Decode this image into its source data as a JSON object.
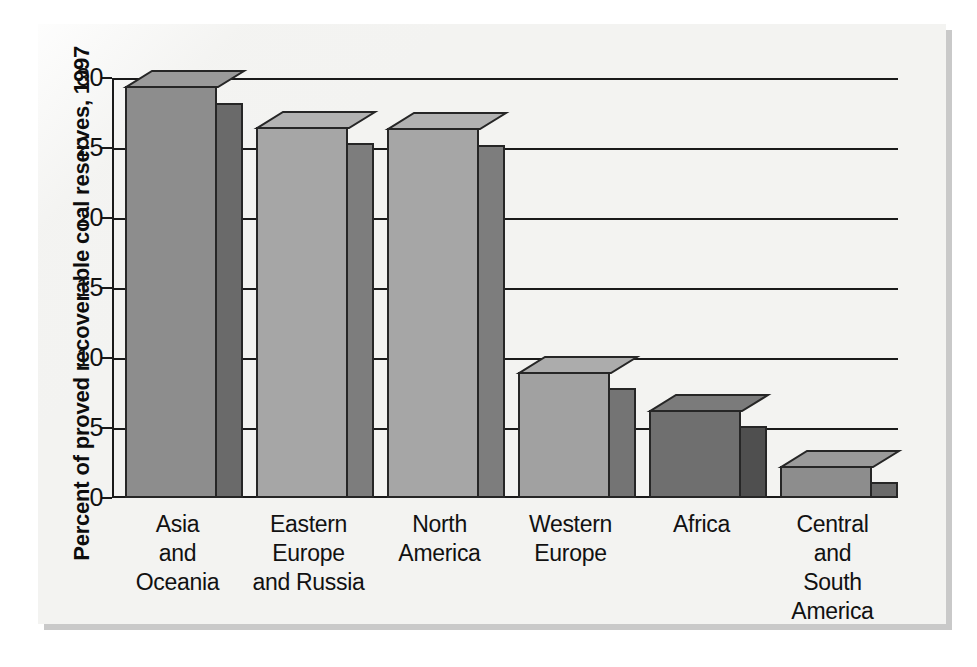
{
  "chart_data": {
    "type": "bar",
    "title": "",
    "subtitle": "",
    "xlabel": "",
    "ylabel": "Percent of proved recoverable coal reserves, 1997",
    "categories": [
      "Asia\nand\nOceania",
      "Eastern\nEurope\nand Russia",
      "North\nAmerica",
      "Western\nEurope",
      "Africa",
      "Central\nand\nSouth\nAmerica"
    ],
    "values": [
      29.4,
      26.5,
      26.4,
      9.0,
      6.3,
      2.3
    ],
    "ylim": [
      0,
      30
    ],
    "yticks": [
      0,
      5,
      10,
      15,
      20,
      25,
      30
    ],
    "ytick_labels": [
      "0",
      "5",
      "10",
      "15",
      "20",
      "25",
      "30"
    ],
    "grid": true,
    "legend": "none",
    "bar_style": "3d-extruded",
    "bar_colors": [
      "#8d8d8d",
      "#a6a6a6",
      "#a6a6a6",
      "#a1a1a1",
      "#6f6f6f",
      "#8d8d8d"
    ],
    "bar_side_colors": [
      "#6a6a6a",
      "#7d7d7d",
      "#7d7d7d",
      "#747474",
      "#4f4f4f",
      "#6a6a6a"
    ],
    "bar_top_colors": [
      "#9a9a9a",
      "#b2b2b2",
      "#b2b2b2",
      "#acacac",
      "#7b7b7b",
      "#9a9a9a"
    ],
    "annotations": []
  },
  "axis": {
    "y_title": "Percent of proved recoverable coal reserves, 1997"
  },
  "palette": {
    "paper": "#f3f3f1",
    "ink": "#111111",
    "axis": "#1a1a1a",
    "shadow": "#c9c9c9"
  }
}
